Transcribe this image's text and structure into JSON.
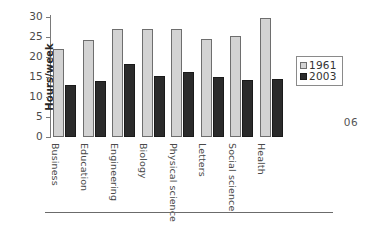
{
  "page_number": "06",
  "legend": {
    "position": "right",
    "entries": [
      {
        "label": "1961",
        "color": "#d3d3d3"
      },
      {
        "label": "2003",
        "color": "#2b2b2b"
      }
    ]
  },
  "axes": {
    "ylabel": "Hours/week",
    "yticks": [
      "30",
      "25",
      "20",
      "15",
      "10",
      "5",
      "0"
    ]
  },
  "chart_data": {
    "type": "bar",
    "title": "",
    "xlabel": "",
    "ylabel": "Hours/week",
    "ylim": [
      0,
      30
    ],
    "ytick_values": [
      0,
      5,
      10,
      15,
      20,
      25,
      30
    ],
    "grid": false,
    "legend_position": "right",
    "categories": [
      "Business",
      "Education",
      "Engineering",
      "Biology",
      "Physical science",
      "Letters",
      "Social science",
      "Health"
    ],
    "series": [
      {
        "name": "1961",
        "color": "#d3d3d3",
        "values": [
          22.1,
          24.3,
          27.0,
          27.1,
          26.9,
          24.5,
          25.3,
          29.8
        ]
      },
      {
        "name": "2003",
        "color": "#2b2b2b",
        "values": [
          13.1,
          13.9,
          18.2,
          15.3,
          16.2,
          15.1,
          14.3,
          14.6
        ]
      }
    ]
  }
}
